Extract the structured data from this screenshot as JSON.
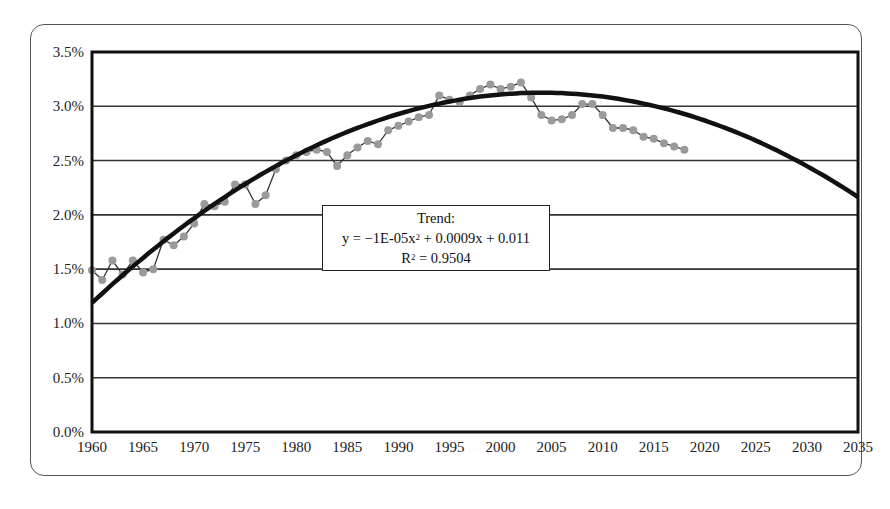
{
  "chart_data": {
    "type": "line",
    "title": "",
    "xlabel": "",
    "ylabel": "",
    "x_ticks": [
      "1960",
      "1965",
      "1970",
      "1975",
      "1980",
      "1985",
      "1990",
      "1995",
      "2000",
      "2005",
      "2010",
      "2015",
      "2020",
      "2025",
      "2030",
      "2035"
    ],
    "y_ticks": [
      "0.0%",
      "0.5%",
      "1.0%",
      "1.5%",
      "2.0%",
      "2.5%",
      "3.0%",
      "3.5%"
    ],
    "xlim": [
      1960,
      2035
    ],
    "ylim": [
      0,
      3.5
    ],
    "grid": "horizontal",
    "legend": null,
    "series": [
      {
        "name": "Observed",
        "style": "gray markers with thin dark connecting line",
        "x": [
          1960,
          1961,
          1962,
          1963,
          1964,
          1965,
          1966,
          1967,
          1968,
          1969,
          1970,
          1971,
          1972,
          1973,
          1974,
          1975,
          1976,
          1977,
          1978,
          1979,
          1980,
          1981,
          1982,
          1983,
          1984,
          1985,
          1986,
          1987,
          1988,
          1989,
          1990,
          1991,
          1992,
          1993,
          1994,
          1995,
          1996,
          1997,
          1998,
          1999,
          2000,
          2001,
          2002,
          2003,
          2004,
          2005,
          2006,
          2007,
          2008,
          2009,
          2010,
          2011,
          2012,
          2013,
          2014,
          2015,
          2016,
          2017,
          2018
        ],
        "values": [
          1.49,
          1.4,
          1.58,
          1.45,
          1.58,
          1.47,
          1.5,
          1.77,
          1.72,
          1.8,
          1.92,
          2.1,
          2.08,
          2.12,
          2.28,
          2.28,
          2.1,
          2.18,
          2.42,
          2.5,
          2.55,
          2.58,
          2.6,
          2.58,
          2.45,
          2.55,
          2.62,
          2.68,
          2.65,
          2.78,
          2.82,
          2.86,
          2.9,
          2.92,
          3.1,
          3.06,
          3.04,
          3.1,
          3.16,
          3.2,
          3.16,
          3.18,
          3.22,
          3.08,
          2.92,
          2.87,
          2.88,
          2.92,
          3.02,
          3.02,
          2.92,
          2.8,
          2.8,
          2.78,
          2.72,
          2.7,
          2.66,
          2.63,
          2.6
        ]
      },
      {
        "name": "Trend (polynomial, order 2)",
        "style": "thick black curve",
        "x_range": [
          1960,
          2035
        ],
        "equation_note": "fitted on t = year - 1959",
        "coefficients": {
          "a": -1e-05,
          "b": 0.0009,
          "c": 0.011
        }
      }
    ],
    "annotations": [
      {
        "label": "Trend:",
        "equation": "y = −1E-05x² + 0.0009x + 0.011",
        "r_squared": "R² = 0.9504"
      }
    ]
  },
  "trend_box": {
    "title": "Trend:",
    "eq_prefix": "y = −1E-05x",
    "eq_sup": "2",
    "eq_suffix": " + 0.0009x + 0.011",
    "r_prefix": "R",
    "r_sup": "2",
    "r_suffix": " = 0.9504"
  }
}
